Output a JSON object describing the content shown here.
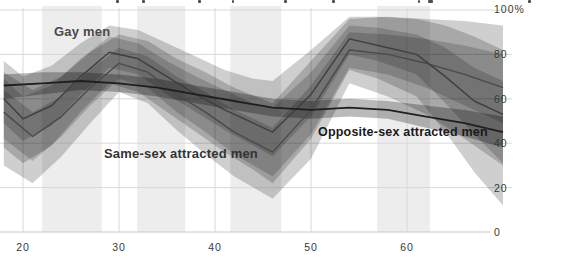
{
  "annotations": {
    "gay_label": "Gay men",
    "same_sex_label": "Same-sex attracted men",
    "opposite_sex_label": "Opposite-sex attracted men"
  },
  "axes": {
    "y_labels": [
      "100%",
      "80",
      "60",
      "40",
      "20",
      "0"
    ],
    "x_labels": [
      "20",
      "30",
      "40",
      "50",
      "60"
    ]
  },
  "colors": {
    "stripe": "#ededed",
    "grid": "#d8d8d8",
    "baseline": "#c9c9c9",
    "band_fill": "#000000",
    "gay_line": "#3f3f3f",
    "same_sex_line": "#4a4a4a",
    "opposite_line": "#1f1f1f",
    "axis_text": "#3a3a3a"
  },
  "caption_fragments": [
    {
      "x": 116,
      "w": 3
    },
    {
      "x": 142,
      "w": 3
    },
    {
      "x": 198,
      "w": 3
    },
    {
      "x": 232,
      "w": 2
    },
    {
      "x": 284,
      "w": 3
    },
    {
      "x": 332,
      "w": 3
    },
    {
      "x": 418,
      "w": 2
    },
    {
      "x": 428,
      "w": 5
    },
    {
      "x": 528,
      "w": 3
    }
  ],
  "chart_data": {
    "type": "line",
    "title": "",
    "xlabel": "age",
    "ylabel": "percent",
    "x_domain": [
      18,
      70
    ],
    "ylim": [
      0,
      100
    ],
    "x_ticks": [
      20,
      30,
      40,
      50,
      60
    ],
    "y_ticks": [
      0,
      20,
      40,
      60,
      80,
      100
    ],
    "grid": true,
    "legend_position": "inline-annotations",
    "background_stripes_age_ranges": [
      [
        22,
        28.2
      ],
      [
        31.9,
        36.9
      ],
      [
        41.6,
        46.9
      ],
      [
        56.9,
        62.4
      ]
    ],
    "series": [
      {
        "name": "Gay men",
        "ages": [
          18,
          20,
          23,
          26,
          29,
          32,
          35,
          38,
          41,
          44,
          46,
          50,
          54,
          57,
          61,
          64,
          67,
          70
        ],
        "values": [
          60,
          51,
          57,
          70,
          81,
          78,
          70,
          62,
          55,
          49,
          45,
          62,
          87,
          84,
          80,
          70,
          59,
          53
        ],
        "inner_hi": [
          69,
          61,
          66,
          78,
          88,
          85,
          77,
          70,
          64,
          58,
          56,
          72,
          93,
          92,
          89,
          83,
          74,
          68
        ],
        "inner_lo": [
          49,
          41,
          48,
          62,
          74,
          71,
          62,
          54,
          46,
          39,
          34,
          52,
          80,
          77,
          71,
          58,
          44,
          31
        ],
        "outer_hi": [
          77,
          70,
          75,
          85,
          93,
          91,
          85,
          79,
          73,
          69,
          68,
          82,
          97,
          97,
          96,
          93,
          88,
          82
        ],
        "outer_lo": [
          38,
          31,
          39,
          54,
          67,
          63,
          54,
          45,
          36,
          28,
          22,
          42,
          73,
          69,
          61,
          45,
          27,
          12
        ]
      },
      {
        "name": "Same-sex attracted men",
        "ages": [
          18,
          21,
          24,
          27,
          30,
          33,
          36,
          39,
          42,
          46,
          50,
          54,
          58,
          62,
          66,
          70
        ],
        "values": [
          54,
          43,
          52,
          65,
          76,
          72,
          62,
          54,
          45,
          36,
          55,
          82,
          80,
          76,
          71,
          65
        ],
        "inner_hi": [
          64,
          54,
          61,
          73,
          83,
          79,
          70,
          63,
          55,
          47,
          66,
          90,
          89,
          87,
          84,
          80
        ],
        "inner_lo": [
          42,
          32,
          43,
          57,
          69,
          65,
          54,
          45,
          35,
          25,
          44,
          74,
          71,
          65,
          57,
          49
        ],
        "outer_hi": [
          72,
          64,
          70,
          81,
          89,
          86,
          78,
          72,
          65,
          58,
          77,
          96,
          97,
          96,
          95,
          93
        ],
        "outer_lo": [
          30,
          22,
          34,
          49,
          63,
          58,
          46,
          35,
          25,
          15,
          33,
          67,
          61,
          53,
          42,
          30
        ]
      },
      {
        "name": "Opposite-sex attracted men",
        "ages": [
          18,
          22,
          26,
          30,
          34,
          38,
          42,
          46,
          50,
          54,
          58,
          62,
          66,
          70
        ],
        "values": [
          66,
          67,
          68,
          67,
          65,
          62,
          59,
          56,
          55,
          56,
          55,
          52,
          49,
          45
        ],
        "band_hi": [
          71,
          72,
          72,
          71,
          69,
          66,
          63,
          60,
          59,
          60,
          59,
          57,
          55,
          52
        ],
        "band_lo": [
          60,
          62,
          64,
          63,
          61,
          58,
          55,
          52,
          51,
          52,
          51,
          47,
          43,
          38
        ]
      }
    ]
  }
}
